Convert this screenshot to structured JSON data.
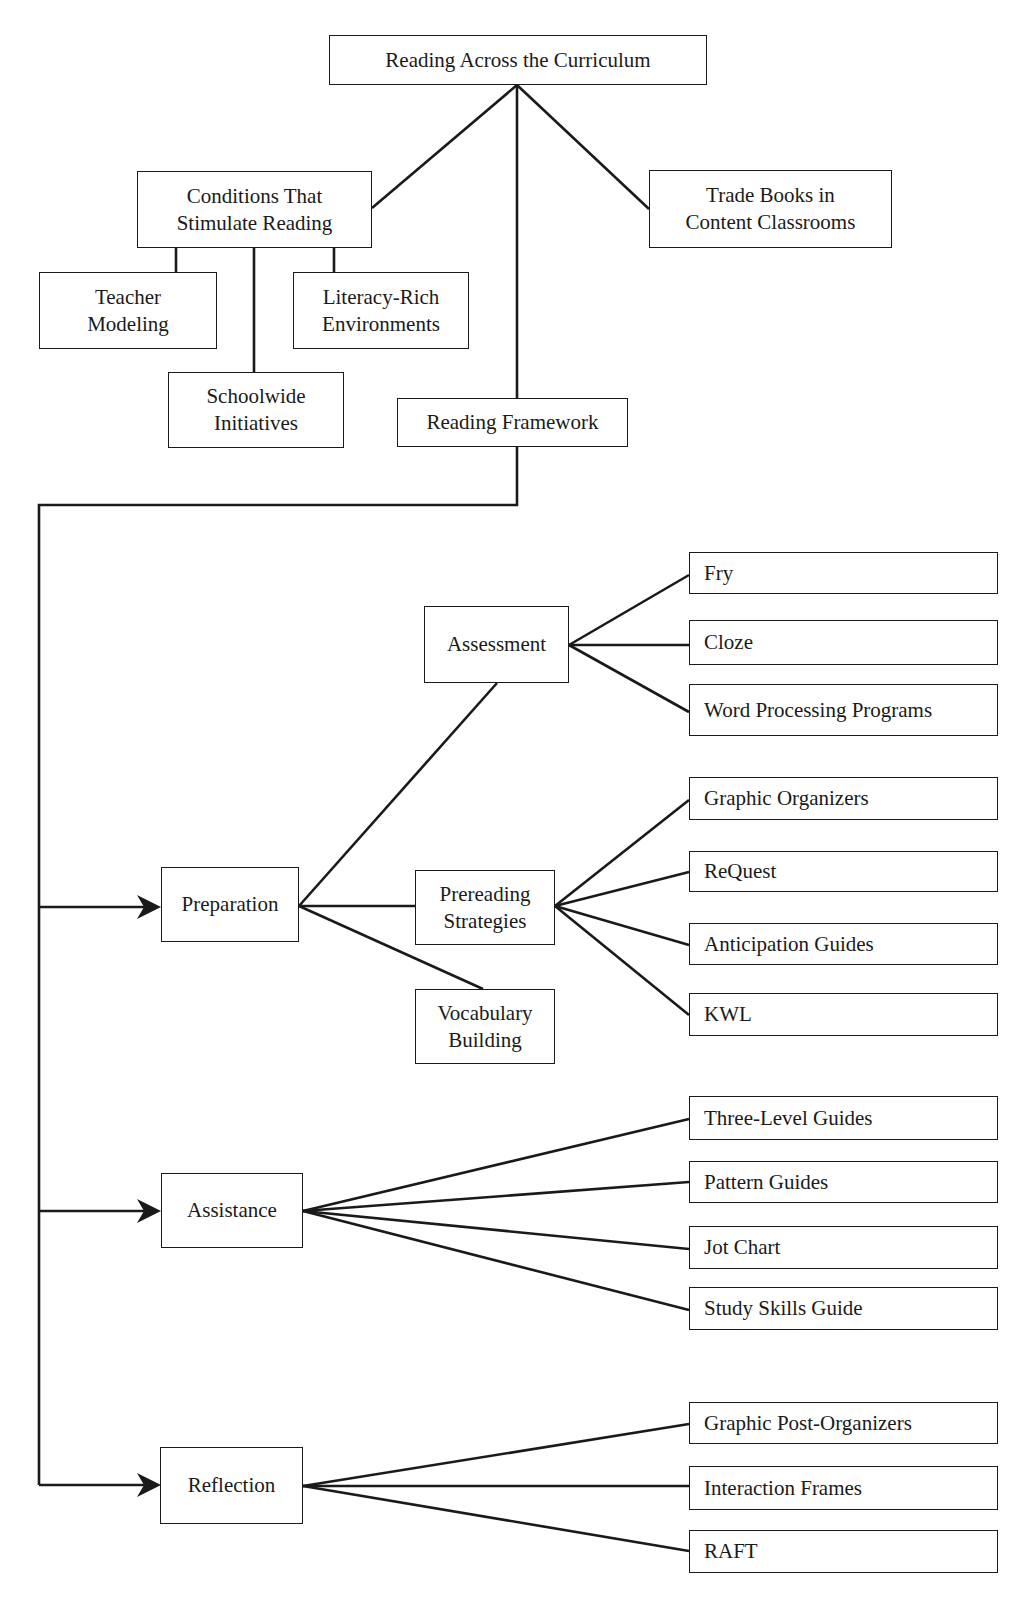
{
  "diagram": {
    "title": "Reading Across the Curriculum",
    "colors": {
      "line": "#1a1a1a",
      "box_border": "#1a1a1a",
      "text": "#1a1a1a",
      "background": "#ffffff"
    },
    "nodes": [
      {
        "id": "root",
        "label": "Reading Across the Curriculum",
        "x": 329,
        "y": 35,
        "w": 378,
        "h": 50,
        "align": "center"
      },
      {
        "id": "conditions",
        "label": "Conditions That\nStimulate Reading",
        "x": 137,
        "y": 171,
        "w": 235,
        "h": 77,
        "align": "center"
      },
      {
        "id": "trade_books",
        "label": "Trade Books in\nContent Classrooms",
        "x": 649,
        "y": 170,
        "w": 243,
        "h": 78,
        "align": "center"
      },
      {
        "id": "teacher_modeling",
        "label": "Teacher\nModeling",
        "x": 39,
        "y": 272,
        "w": 178,
        "h": 77,
        "align": "center"
      },
      {
        "id": "literacy_rich",
        "label": "Literacy-Rich\nEnvironments",
        "x": 293,
        "y": 272,
        "w": 176,
        "h": 77,
        "align": "center"
      },
      {
        "id": "schoolwide",
        "label": "Schoolwide\nInitiatives",
        "x": 168,
        "y": 372,
        "w": 176,
        "h": 76,
        "align": "center"
      },
      {
        "id": "reading_framework",
        "label": "Reading Framework",
        "x": 397,
        "y": 398,
        "w": 231,
        "h": 49,
        "align": "center"
      },
      {
        "id": "preparation",
        "label": "Preparation",
        "x": 161,
        "y": 867,
        "w": 138,
        "h": 75,
        "align": "center"
      },
      {
        "id": "assistance",
        "label": "Assistance",
        "x": 161,
        "y": 1173,
        "w": 142,
        "h": 75,
        "align": "center"
      },
      {
        "id": "reflection",
        "label": "Reflection",
        "x": 160,
        "y": 1447,
        "w": 143,
        "h": 77,
        "align": "center"
      },
      {
        "id": "assessment",
        "label": "Assessment",
        "x": 424,
        "y": 606,
        "w": 145,
        "h": 77,
        "align": "center"
      },
      {
        "id": "prereading",
        "label": "Prereading\nStrategies",
        "x": 415,
        "y": 870,
        "w": 140,
        "h": 75,
        "align": "center"
      },
      {
        "id": "vocabulary",
        "label": "Vocabulary\nBuilding",
        "x": 415,
        "y": 989,
        "w": 140,
        "h": 75,
        "align": "center"
      },
      {
        "id": "fry",
        "label": "Fry",
        "x": 689,
        "y": 552,
        "w": 309,
        "h": 42,
        "align": "left"
      },
      {
        "id": "cloze",
        "label": "Cloze",
        "x": 689,
        "y": 620,
        "w": 309,
        "h": 45,
        "align": "left"
      },
      {
        "id": "word_processing",
        "label": "Word Processing Programs",
        "x": 689,
        "y": 684,
        "w": 309,
        "h": 52,
        "align": "left"
      },
      {
        "id": "graphic_organizers",
        "label": "Graphic Organizers",
        "x": 689,
        "y": 777,
        "w": 309,
        "h": 43,
        "align": "left"
      },
      {
        "id": "request",
        "label": "ReQuest",
        "x": 689,
        "y": 851,
        "w": 309,
        "h": 41,
        "align": "left"
      },
      {
        "id": "anticipation_guides",
        "label": "Anticipation Guides",
        "x": 689,
        "y": 923,
        "w": 309,
        "h": 42,
        "align": "left"
      },
      {
        "id": "kwl",
        "label": "KWL",
        "x": 689,
        "y": 993,
        "w": 309,
        "h": 43,
        "align": "left"
      },
      {
        "id": "three_level_guides",
        "label": "Three-Level Guides",
        "x": 689,
        "y": 1096,
        "w": 309,
        "h": 44,
        "align": "left"
      },
      {
        "id": "pattern_guides",
        "label": "Pattern Guides",
        "x": 689,
        "y": 1161,
        "w": 309,
        "h": 42,
        "align": "left"
      },
      {
        "id": "jot_chart",
        "label": "Jot Chart",
        "x": 689,
        "y": 1226,
        "w": 309,
        "h": 43,
        "align": "left"
      },
      {
        "id": "study_skills_guide",
        "label": "Study Skills Guide",
        "x": 689,
        "y": 1287,
        "w": 309,
        "h": 43,
        "align": "left"
      },
      {
        "id": "graphic_post_organizers",
        "label": "Graphic Post-Organizers",
        "x": 689,
        "y": 1402,
        "w": 309,
        "h": 42,
        "align": "left"
      },
      {
        "id": "interaction_frames",
        "label": "Interaction Frames",
        "x": 689,
        "y": 1466,
        "w": 309,
        "h": 44,
        "align": "left"
      },
      {
        "id": "raft",
        "label": "RAFT",
        "x": 689,
        "y": 1530,
        "w": 309,
        "h": 43,
        "align": "left"
      }
    ],
    "edges": [
      {
        "from": "root",
        "to": "conditions",
        "points": [
          [
            517,
            85
          ],
          [
            372,
            208
          ]
        ]
      },
      {
        "from": "root",
        "to": "reading_framework",
        "points": [
          [
            517,
            85
          ],
          [
            517,
            398
          ]
        ]
      },
      {
        "from": "root",
        "to": "trade_books",
        "points": [
          [
            517,
            85
          ],
          [
            649,
            209
          ]
        ]
      },
      {
        "from": "conditions",
        "to": "teacher_modeling",
        "points": [
          [
            176,
            248
          ],
          [
            176,
            272
          ]
        ]
      },
      {
        "from": "conditions",
        "to": "schoolwide",
        "points": [
          [
            254,
            248
          ],
          [
            254,
            372
          ]
        ]
      },
      {
        "from": "conditions",
        "to": "literacy_rich",
        "points": [
          [
            334,
            248
          ],
          [
            334,
            272
          ]
        ]
      },
      {
        "from": "reading_framework",
        "to": "phases",
        "points": [
          [
            517,
            447
          ],
          [
            517,
            505
          ],
          [
            39,
            505
          ],
          [
            39,
            1485
          ]
        ]
      },
      {
        "from": "spine",
        "to": "preparation",
        "points": [
          [
            39,
            907
          ],
          [
            150,
            907
          ]
        ],
        "arrow": true
      },
      {
        "from": "spine",
        "to": "assistance",
        "points": [
          [
            39,
            1211
          ],
          [
            150,
            1211
          ]
        ],
        "arrow": true
      },
      {
        "from": "spine",
        "to": "reflection",
        "points": [
          [
            39,
            1485
          ],
          [
            150,
            1485
          ]
        ],
        "arrow": true
      },
      {
        "from": "preparation",
        "to": "assessment",
        "points": [
          [
            299,
            906
          ],
          [
            497,
            683
          ]
        ]
      },
      {
        "from": "preparation",
        "to": "prereading",
        "points": [
          [
            299,
            906
          ],
          [
            415,
            906
          ]
        ]
      },
      {
        "from": "preparation",
        "to": "vocabulary",
        "points": [
          [
            299,
            906
          ],
          [
            483,
            989
          ]
        ]
      },
      {
        "from": "assessment",
        "to": "fry",
        "points": [
          [
            569,
            645
          ],
          [
            689,
            575
          ]
        ]
      },
      {
        "from": "assessment",
        "to": "cloze",
        "points": [
          [
            569,
            645
          ],
          [
            689,
            645
          ]
        ]
      },
      {
        "from": "assessment",
        "to": "word_processing",
        "points": [
          [
            569,
            645
          ],
          [
            689,
            712
          ]
        ]
      },
      {
        "from": "prereading",
        "to": "graphic_organizers",
        "points": [
          [
            555,
            906
          ],
          [
            689,
            800
          ]
        ]
      },
      {
        "from": "prereading",
        "to": "request",
        "points": [
          [
            555,
            906
          ],
          [
            689,
            872
          ]
        ]
      },
      {
        "from": "prereading",
        "to": "anticipation_guides",
        "points": [
          [
            555,
            906
          ],
          [
            689,
            945
          ]
        ]
      },
      {
        "from": "prereading",
        "to": "kwl",
        "points": [
          [
            555,
            906
          ],
          [
            689,
            1015
          ]
        ]
      },
      {
        "from": "assistance",
        "to": "three_level_guides",
        "points": [
          [
            303,
            1211
          ],
          [
            689,
            1119
          ]
        ]
      },
      {
        "from": "assistance",
        "to": "pattern_guides",
        "points": [
          [
            303,
            1211
          ],
          [
            689,
            1182
          ]
        ]
      },
      {
        "from": "assistance",
        "to": "jot_chart",
        "points": [
          [
            303,
            1211
          ],
          [
            689,
            1249
          ]
        ]
      },
      {
        "from": "assistance",
        "to": "study_skills_guide",
        "points": [
          [
            303,
            1211
          ],
          [
            689,
            1310
          ]
        ]
      },
      {
        "from": "reflection",
        "to": "graphic_post_organizers",
        "points": [
          [
            303,
            1486
          ],
          [
            689,
            1424
          ]
        ]
      },
      {
        "from": "reflection",
        "to": "interaction_frames",
        "points": [
          [
            303,
            1486
          ],
          [
            689,
            1486
          ]
        ]
      },
      {
        "from": "reflection",
        "to": "raft",
        "points": [
          [
            303,
            1486
          ],
          [
            689,
            1551
          ]
        ]
      }
    ]
  }
}
